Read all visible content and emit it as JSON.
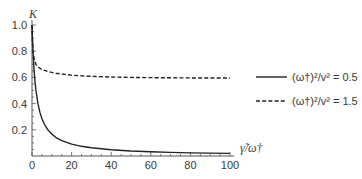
{
  "chart_data": {
    "type": "line",
    "title": "",
    "xlabel": "γ̃/ω†",
    "ylabel": "K",
    "xlim": [
      0,
      100
    ],
    "ylim": [
      0,
      1.0
    ],
    "grid": false,
    "legend": "right",
    "xticks": [
      {
        "value": 0,
        "label": "0"
      },
      {
        "value": 20,
        "label": "20"
      },
      {
        "value": 40,
        "label": "40"
      },
      {
        "value": 60,
        "label": "60"
      },
      {
        "value": 80,
        "label": "80"
      },
      {
        "value": 100,
        "label": "100"
      }
    ],
    "yticks": [
      {
        "value": 0.2,
        "label": "0.2"
      },
      {
        "value": 0.4,
        "label": "0.4"
      },
      {
        "value": 0.6,
        "label": "0.6"
      },
      {
        "value": 0.8,
        "label": "0.8"
      },
      {
        "value": 1.0,
        "label": "1.0"
      }
    ],
    "x_minor_step": 5,
    "y_minor_step": 0.05,
    "x": [
      0,
      0.25,
      0.5,
      1,
      1.5,
      2,
      3,
      4,
      5,
      6,
      8,
      10,
      12,
      15,
      20,
      25,
      30,
      40,
      50,
      60,
      70,
      80,
      90,
      100
    ],
    "series": [
      {
        "name": "(ω†)²/v² = 0.5",
        "style": "solid",
        "values": [
          1.0,
          0.889,
          0.8,
          0.667,
          0.571,
          0.5,
          0.4,
          0.333,
          0.286,
          0.25,
          0.2,
          0.167,
          0.143,
          0.118,
          0.091,
          0.074,
          0.0625,
          0.048,
          0.038,
          0.032,
          0.028,
          0.024,
          0.022,
          0.02
        ]
      },
      {
        "name": "(ω†)²/v² = 1.5",
        "style": "dashed",
        "values": [
          1.0,
          0.86,
          0.8,
          0.75,
          0.72,
          0.7,
          0.68,
          0.67,
          0.66,
          0.655,
          0.645,
          0.638,
          0.632,
          0.625,
          0.617,
          0.612,
          0.608,
          0.603,
          0.6,
          0.598,
          0.597,
          0.596,
          0.595,
          0.595
        ]
      }
    ],
    "colors": {
      "line": "#222222",
      "axis": "#555555",
      "text": "#3a3a3a"
    }
  }
}
